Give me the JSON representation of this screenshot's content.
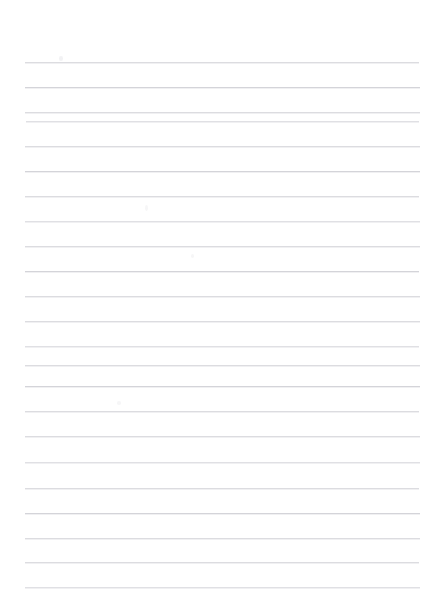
{
  "document": {
    "kind": "lined-paper",
    "title": "",
    "background_color": "#ffffff",
    "width": 441,
    "height": 614,
    "body_text": ""
  },
  "ruling": {
    "line_color": "#d9d9dd",
    "line_count": 22,
    "line_thickness_px": 1,
    "first_line_y": 62,
    "line_spacing_px": 25,
    "left_margin_x": 25,
    "right_margin_x": 420,
    "margin_rule": "none",
    "lines": [
      {
        "y": 62,
        "x1": 25,
        "x2": 419,
        "tone": "tone-a"
      },
      {
        "y": 87,
        "x1": 25,
        "x2": 420,
        "tone": "tone-b"
      },
      {
        "y": 112,
        "x1": 25,
        "x2": 420,
        "tone": "tone-a"
      },
      {
        "y": 121,
        "x1": 26,
        "x2": 419,
        "tone": "tone-c"
      },
      {
        "y": 146,
        "x1": 25,
        "x2": 420,
        "tone": "tone-a"
      },
      {
        "y": 171,
        "x1": 25,
        "x2": 420,
        "tone": "tone-b"
      },
      {
        "y": 196,
        "x1": 25,
        "x2": 419,
        "tone": "tone-a"
      },
      {
        "y": 221,
        "x1": 25,
        "x2": 420,
        "tone": "tone-c"
      },
      {
        "y": 246,
        "x1": 25,
        "x2": 420,
        "tone": "tone-a"
      },
      {
        "y": 271,
        "x1": 25,
        "x2": 419,
        "tone": "tone-b"
      },
      {
        "y": 296,
        "x1": 25,
        "x2": 420,
        "tone": "tone-a"
      },
      {
        "y": 321,
        "x1": 25,
        "x2": 420,
        "tone": "tone-a"
      },
      {
        "y": 346,
        "x1": 25,
        "x2": 419,
        "tone": "tone-c"
      },
      {
        "y": 365,
        "x1": 25,
        "x2": 420,
        "tone": "tone-a"
      },
      {
        "y": 386,
        "x1": 25,
        "x2": 420,
        "tone": "tone-b"
      },
      {
        "y": 411,
        "x1": 25,
        "x2": 419,
        "tone": "tone-a"
      },
      {
        "y": 436,
        "x1": 25,
        "x2": 420,
        "tone": "tone-a"
      },
      {
        "y": 462,
        "x1": 25,
        "x2": 420,
        "tone": "tone-c"
      },
      {
        "y": 488,
        "x1": 25,
        "x2": 419,
        "tone": "tone-a"
      },
      {
        "y": 513,
        "x1": 25,
        "x2": 420,
        "tone": "tone-b"
      },
      {
        "y": 538,
        "x1": 25,
        "x2": 420,
        "tone": "tone-a"
      },
      {
        "y": 562,
        "x1": 25,
        "x2": 419,
        "tone": "tone-a"
      },
      {
        "y": 587,
        "x1": 25,
        "x2": 420,
        "tone": "tone-c"
      }
    ]
  },
  "marks": [
    {
      "x": 59,
      "y": 56,
      "w": 4,
      "h": 5,
      "class": "faint"
    },
    {
      "x": 145,
      "y": 205,
      "w": 3,
      "h": 6,
      "class": "fainter"
    },
    {
      "x": 117,
      "y": 401,
      "w": 4,
      "h": 4,
      "class": "fainter"
    },
    {
      "x": 191,
      "y": 254,
      "w": 3,
      "h": 4,
      "class": "fainter"
    }
  ]
}
